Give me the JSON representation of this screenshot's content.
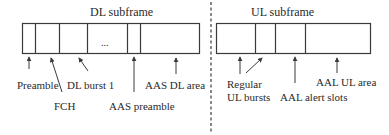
{
  "diagram": {
    "dl": {
      "title": "DL subframe",
      "ellipsis": "...",
      "labels": {
        "preamble": "Preamble",
        "fch": "FCH",
        "dl_burst_1": "DL burst 1",
        "aas_preamble": "AAS preamble",
        "aas_dl_area": "AAS DL area"
      }
    },
    "ul": {
      "title": "UL subframe",
      "labels": {
        "regular_line1": "Regular",
        "regular_line2": "UL bursts",
        "aal_alert_slots": "AAL alert slots",
        "aal_ul_area": "AAL UL area"
      }
    },
    "colors": {
      "stroke": "#3a3a3a",
      "text": "#2a2a2a",
      "background": "#ffffff"
    }
  }
}
